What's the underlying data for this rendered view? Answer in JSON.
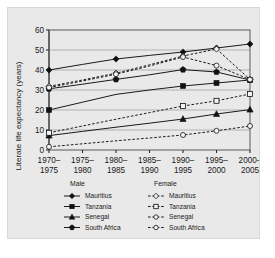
{
  "chart_data": {
    "type": "line",
    "title": "",
    "xlabel": "",
    "ylabel": "Literate life expectancy (years)",
    "categories": [
      "1970–1975",
      "1975–1980",
      "1980–1985",
      "1985–1990",
      "1990–1995",
      "1995–2000",
      "2000–2005"
    ],
    "ylim": [
      0,
      60
    ],
    "yticks": [
      0,
      10,
      20,
      30,
      40,
      50,
      60
    ],
    "grid": true,
    "legend_position": "below-axes",
    "legend_groups": [
      {
        "heading": "Male",
        "style": "solid-filled"
      },
      {
        "heading": "Female",
        "style": "dashed-open"
      }
    ],
    "series": [
      {
        "name": "Mauritius",
        "sex": "Male",
        "marker": "diamond",
        "line": "solid",
        "filled": true,
        "values": [
          40.0,
          42.8,
          45.5,
          47.3,
          49.0,
          51.0,
          53.0
        ],
        "marker_at": [
          0,
          2,
          4,
          5,
          6
        ]
      },
      {
        "name": "Tanzania",
        "sex": "Male",
        "marker": "square",
        "line": "solid",
        "filled": true,
        "values": [
          20.0,
          23.9,
          27.8,
          30.0,
          32.0,
          33.5,
          35.0
        ],
        "marker_at": [
          0,
          4,
          5,
          6
        ]
      },
      {
        "name": "Senegal",
        "sex": "Male",
        "marker": "triangle",
        "line": "solid",
        "filled": true,
        "values": [
          7.2,
          9.3,
          11.4,
          13.4,
          15.5,
          18.0,
          20.2
        ],
        "marker_at": [
          0,
          4,
          5,
          6
        ]
      },
      {
        "name": "South Africa",
        "sex": "Male",
        "marker": "pentagon",
        "line": "solid",
        "filled": true,
        "values": [
          30.6,
          32.9,
          35.3,
          37.6,
          40.2,
          39.0,
          35.0
        ],
        "marker_at": [
          0,
          2,
          4,
          5,
          6
        ]
      },
      {
        "name": "Mauritius",
        "sex": "Female",
        "marker": "diamond",
        "line": "dashed",
        "filled": false,
        "values": [
          31.8,
          35.0,
          38.4,
          42.6,
          47.0,
          50.5,
          35.3
        ],
        "marker_at": [
          0,
          2,
          4,
          5,
          6
        ]
      },
      {
        "name": "Tanzania",
        "sex": "Female",
        "marker": "square",
        "line": "dashed",
        "filled": false,
        "values": [
          8.6,
          12.0,
          15.4,
          18.7,
          22.0,
          24.6,
          28.0
        ],
        "marker_at": [
          0,
          4,
          5,
          6
        ]
      },
      {
        "name": "Senegal",
        "sex": "Female",
        "marker": "circle",
        "line": "dashed",
        "filled": false,
        "values": [
          1.6,
          3.1,
          4.6,
          6.0,
          7.5,
          9.6,
          12.0
        ],
        "marker_at": [
          0,
          4,
          5,
          6
        ]
      },
      {
        "name": "South Africa",
        "sex": "Female",
        "marker": "circle",
        "line": "dashed",
        "filled": false,
        "values": [
          31.2,
          34.5,
          37.9,
          42.0,
          46.5,
          42.2,
          35.2
        ],
        "marker_at": [
          0,
          2,
          4,
          5,
          6
        ]
      }
    ],
    "colors": {
      "line": "#1a1a1a",
      "grid": "#8f8f8f",
      "panel_background": "#e9e9e9",
      "plot_background": "#ececec"
    }
  },
  "legend": {
    "male_heading": "Male",
    "female_heading": "Female",
    "male_items": [
      "Mauritius",
      "Tanzania",
      "Senegal",
      "South Africa"
    ],
    "female_items": [
      "Mauritius",
      "Tanzania",
      "Senegal",
      "South Africa"
    ]
  }
}
